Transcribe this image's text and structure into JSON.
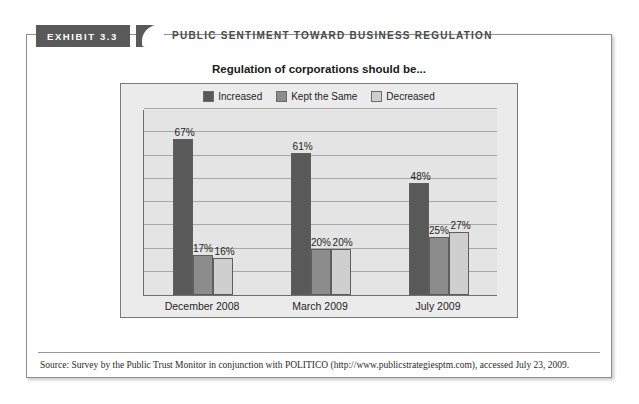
{
  "exhibit": {
    "tab_label": "EXHIBIT 3.3",
    "header_title": "PUBLIC SENTIMENT TOWARD BUSINESS REGULATION"
  },
  "source": {
    "text": "Source: Survey by the Public Trust Monitor in conjunction with POLITICO (http://www.publicstrategiesptm.com), accessed July 23, 2009."
  },
  "colors": {
    "increased": "#595959",
    "kept_the_same": "#8c8c8c",
    "decreased": "#cfcfcf",
    "plot_background": "#e4e4e4",
    "chart_background": "#ebebeb",
    "gridline": "#a8a8a8",
    "tab_background": "#595959"
  },
  "chart_data": {
    "type": "bar",
    "title": "Regulation of corporations should be...",
    "xlabel": "",
    "ylabel": "",
    "ylim": [
      0,
      80
    ],
    "ytick_step": 10,
    "grid": true,
    "legend_position": "top",
    "categories": [
      "December 2008",
      "March 2009",
      "July 2009"
    ],
    "series": [
      {
        "name": "Increased",
        "color": "#595959",
        "values": [
          67,
          61,
          48
        ],
        "labels": [
          "67%",
          "61%",
          "48%"
        ]
      },
      {
        "name": "Kept the Same",
        "color": "#8c8c8c",
        "values": [
          17,
          20,
          25
        ],
        "labels": [
          "17%",
          "20%",
          "25%"
        ]
      },
      {
        "name": "Decreased",
        "color": "#cfcfcf",
        "values": [
          16,
          20,
          27
        ],
        "labels": [
          "16%",
          "20%",
          "27%"
        ]
      }
    ]
  }
}
